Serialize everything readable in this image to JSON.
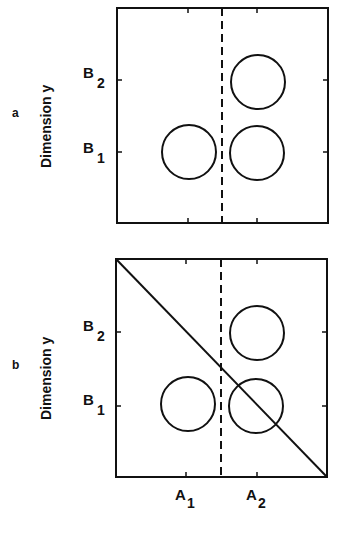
{
  "figure": {
    "y_axis_label": "Dimension y",
    "x_tick_labels": [
      {
        "main": "A",
        "sub": "1"
      },
      {
        "main": "A",
        "sub": "2"
      }
    ],
    "y_tick_labels": [
      {
        "main": "B",
        "sub": "2"
      },
      {
        "main": "B",
        "sub": "1"
      }
    ],
    "colors": {
      "stroke": "#111111",
      "background": "#ffffff"
    }
  },
  "panels": [
    {
      "id": "a",
      "label": "a",
      "box": {
        "x": 117,
        "y": 8,
        "w": 211,
        "h": 215
      },
      "x_ticks": [
        188,
        257
      ],
      "y_ticks": [
        80,
        152
      ],
      "dashed_boundary_x": 222,
      "diagonal": null,
      "circles": [
        {
          "name": "A1B1",
          "cx": 189,
          "cy": 152,
          "r": 27
        },
        {
          "name": "A2B2",
          "cx": 258,
          "cy": 82,
          "r": 27
        },
        {
          "name": "A2B1",
          "cx": 257,
          "cy": 153,
          "r": 27
        }
      ],
      "show_x_labels": false
    },
    {
      "id": "b",
      "label": "b",
      "box": {
        "x": 116,
        "y": 259,
        "w": 211,
        "h": 218
      },
      "x_ticks": [
        186,
        257
      ],
      "y_ticks": [
        332,
        406
      ],
      "dashed_boundary_x": 221,
      "diagonal": {
        "x1": 116,
        "y1": 259,
        "x2": 327,
        "y2": 477
      },
      "circles": [
        {
          "name": "A1B1",
          "cx": 188,
          "cy": 404,
          "r": 27
        },
        {
          "name": "A2B2",
          "cx": 257,
          "cy": 333,
          "r": 27
        },
        {
          "name": "A2B1",
          "cx": 256,
          "cy": 406,
          "r": 27
        }
      ],
      "show_x_labels": true
    }
  ]
}
